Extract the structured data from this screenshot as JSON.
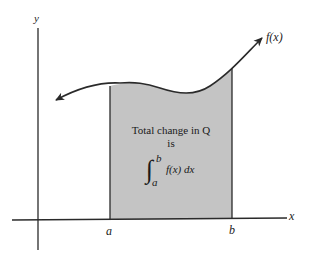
{
  "figure": {
    "type": "area-under-curve diagram",
    "axes": {
      "x_label": "x",
      "y_label": "y"
    },
    "curve_label": "f(x)",
    "bounds": {
      "lower": "a",
      "upper": "b"
    },
    "annotation": {
      "line1": "Total change in Q",
      "line2": "is",
      "integral": {
        "sign": "∫",
        "upper": "b",
        "lower": "a",
        "integrand": "f(x) dx"
      }
    },
    "colors": {
      "shade": "#c4c4c4",
      "line": "#2a2a2a",
      "background": "#ffffff"
    }
  }
}
